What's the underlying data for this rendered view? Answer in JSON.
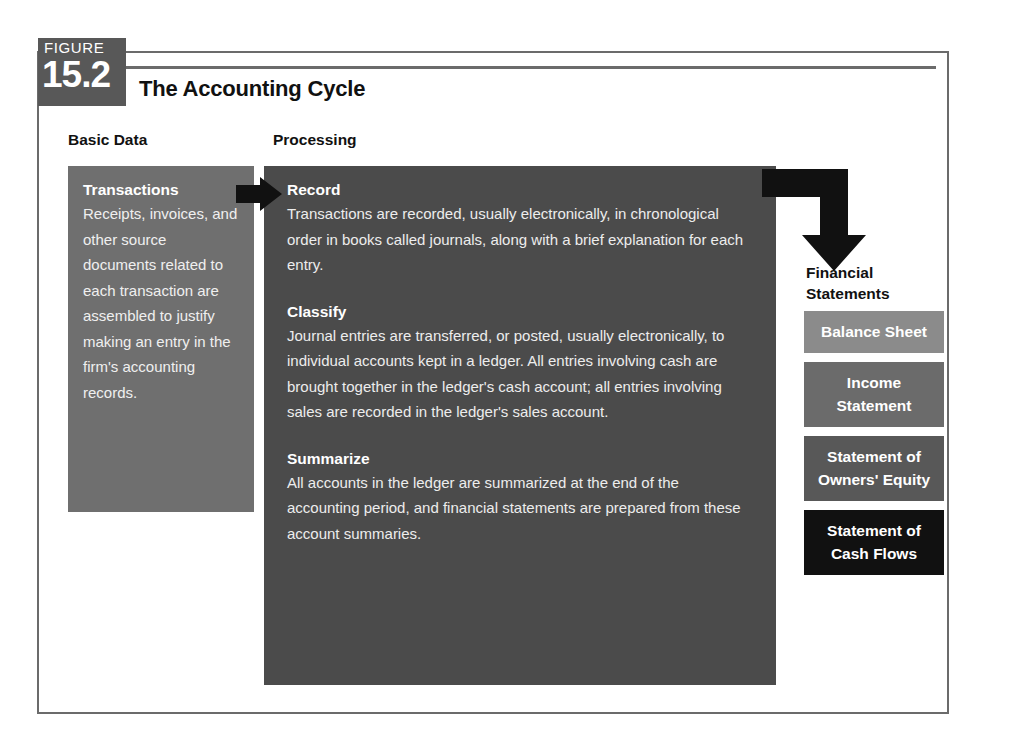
{
  "figure": {
    "label": "FIGURE",
    "number": "15.2",
    "title": "The Accounting Cycle"
  },
  "columns": {
    "basic_data_header": "Basic Data",
    "processing_header": "Processing"
  },
  "basic_data": {
    "title": "Transactions",
    "body": "Receipts, invoices, and other source documents related to each transaction are assembled to justify making an entry in the firm's accounting records."
  },
  "processing": {
    "steps": [
      {
        "title": "Record",
        "body": "Transactions are recorded, usually electronically, in chronological order in books called journals, along with a brief explanation for each entry."
      },
      {
        "title": "Classify",
        "body": "Journal entries are transferred, or posted, usually electronically, to individual accounts kept in a ledger. All entries involving cash are brought together in the ledger's cash account; all entries involving sales are recorded in the ledger's sales account."
      },
      {
        "title": "Summarize",
        "body": "All accounts in the ledger are summarized at the end of the accounting period, and financial statements are prepared from these account summaries."
      }
    ]
  },
  "financial_statements": {
    "heading_line1": "Financial",
    "heading_line2": "Statements",
    "items": [
      {
        "label": "Balance Sheet",
        "color": "#8b8b8b"
      },
      {
        "label": "Income Statement",
        "color": "#6b6b6b"
      },
      {
        "label": "Statement of Owners' Equity",
        "color": "#585858"
      },
      {
        "label": "Statement of Cash Flows",
        "color": "#111111"
      }
    ]
  },
  "icons": {
    "arrow_right": "arrow-right-icon",
    "arrow_elbow_down": "arrow-elbow-down-icon"
  },
  "colors": {
    "frame_border": "#6b6b6b",
    "badge_bg": "#585858",
    "transactions_bg": "#6f6f6f",
    "processing_bg": "#4b4b4b",
    "arrow": "#111111",
    "page_bg": "#ffffff"
  }
}
